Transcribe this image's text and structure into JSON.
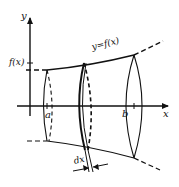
{
  "diagram": {
    "title": "",
    "type": "solid-of-revolution",
    "labels": {
      "y_axis": "y",
      "x_axis": "x",
      "function_value": "f(x)",
      "curve": "y=f(x)",
      "lower_bound": "a",
      "upper_bound": "b",
      "slice_width": "dx"
    },
    "colors": {
      "ink": "#111111",
      "background": "#ffffff"
    }
  }
}
